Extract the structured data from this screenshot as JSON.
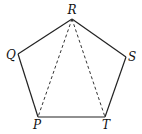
{
  "diagram": {
    "type": "pentagon",
    "vertices": {
      "R": {
        "label": "R",
        "x": 72,
        "y": 19,
        "lx": 72,
        "ly": 14
      },
      "Q": {
        "label": "Q",
        "x": 18,
        "y": 54,
        "lx": 11,
        "ly": 59
      },
      "S": {
        "label": "S",
        "x": 126,
        "y": 57,
        "lx": 132,
        "ly": 61
      },
      "P": {
        "label": "P",
        "x": 38,
        "y": 117,
        "lx": 37,
        "ly": 129
      },
      "T": {
        "label": "T",
        "x": 105,
        "y": 117,
        "lx": 106,
        "ly": 129
      }
    },
    "solid_edges": [
      [
        "R",
        "S"
      ],
      [
        "S",
        "T"
      ],
      [
        "T",
        "P"
      ],
      [
        "P",
        "Q"
      ],
      [
        "Q",
        "R"
      ]
    ],
    "dashed_edges": [
      [
        "R",
        "P"
      ],
      [
        "R",
        "T"
      ]
    ],
    "colors": {
      "line": "#222222",
      "text": "#111111",
      "background": "#ffffff"
    }
  }
}
